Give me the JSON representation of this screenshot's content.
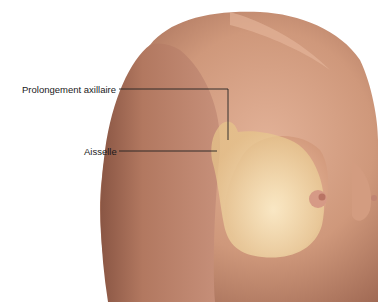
{
  "figure": {
    "labels": [
      {
        "id": "axillary-tail",
        "text": "Prolongement axillaire"
      },
      {
        "id": "armpit",
        "text": "Aisselle"
      }
    ],
    "colors": {
      "skin_light": "#d9a58a",
      "skin_mid": "#c48a6e",
      "skin_dark": "#8e5a44",
      "gland_overlay": "#f0d8a0",
      "leader_line": "#222222"
    }
  }
}
